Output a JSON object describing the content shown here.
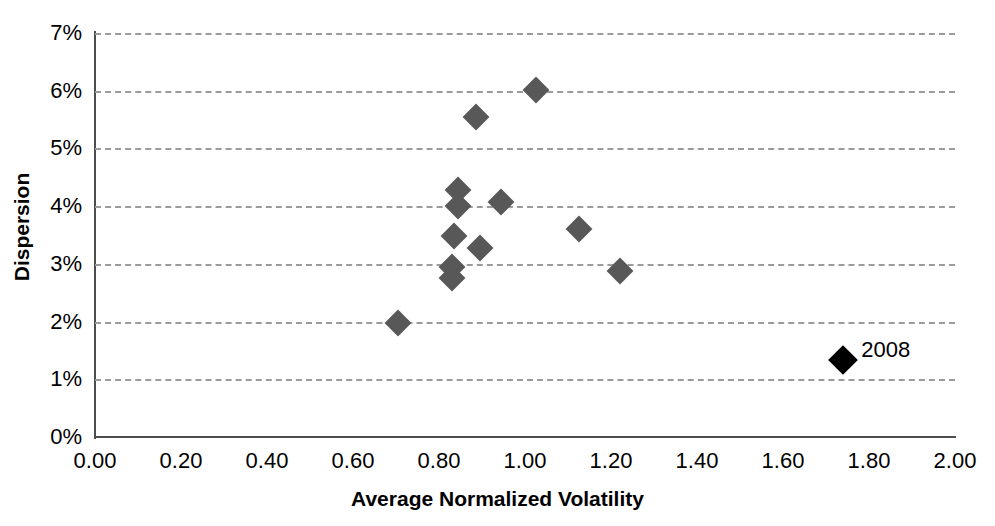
{
  "chart_data": {
    "type": "scatter",
    "title": "",
    "xlabel": "Average Normalized Volatility",
    "ylabel": "Dispersion",
    "xlim": [
      0.0,
      2.0
    ],
    "ylim": [
      0.0,
      7.0
    ],
    "xticks": [
      "0.00",
      "0.20",
      "0.40",
      "0.60",
      "0.80",
      "1.00",
      "1.20",
      "1.40",
      "1.60",
      "1.80",
      "2.00"
    ],
    "xtick_values": [
      0.0,
      0.2,
      0.4,
      0.6,
      0.8,
      1.0,
      1.2,
      1.4,
      1.6,
      1.8,
      2.0
    ],
    "yticks": [
      "0%",
      "1%",
      "2%",
      "3%",
      "4%",
      "5%",
      "6%",
      "7%"
    ],
    "ytick_values": [
      0,
      1,
      2,
      3,
      4,
      5,
      6,
      7
    ],
    "grid": "horizontal-dashed",
    "legend": "none",
    "marker": "diamond",
    "series": [
      {
        "name": "Years",
        "color": "#585858",
        "points": [
          {
            "x": 0.705,
            "y": 1.97
          },
          {
            "x": 0.83,
            "y": 2.95
          },
          {
            "x": 0.83,
            "y": 2.75
          },
          {
            "x": 0.845,
            "y": 4.28
          },
          {
            "x": 0.845,
            "y": 4.01
          },
          {
            "x": 0.835,
            "y": 3.48
          },
          {
            "x": 0.885,
            "y": 5.55
          },
          {
            "x": 0.895,
            "y": 3.28
          },
          {
            "x": 0.945,
            "y": 4.08
          },
          {
            "x": 1.025,
            "y": 6.01
          },
          {
            "x": 1.125,
            "y": 3.6
          },
          {
            "x": 1.22,
            "y": 2.87
          }
        ]
      },
      {
        "name": "2008",
        "color": "#000000",
        "points": [
          {
            "x": 1.74,
            "y": 1.33,
            "label": "2008"
          }
        ]
      }
    ]
  }
}
